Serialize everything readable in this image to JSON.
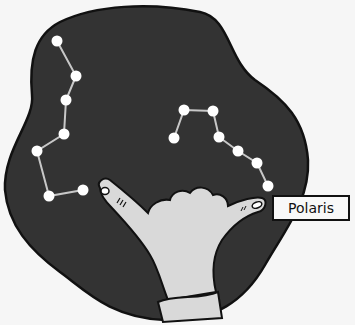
{
  "illustration": {
    "subject": "hand pointing to the North Star",
    "label": "Polaris",
    "colors": {
      "background": "#f6f6f6",
      "sky": "#333333",
      "outline": "#111111",
      "star": "#ffffff",
      "constellation_line": "#c8c8c8",
      "hand": "#d9d9d9",
      "label_bg": "#f8f8f8"
    },
    "constellations": [
      {
        "name": "left-constellation",
        "stars": [
          [
            57,
            41
          ],
          [
            76,
            76
          ],
          [
            66,
            100
          ],
          [
            64,
            134
          ],
          [
            37,
            151
          ],
          [
            49,
            196
          ],
          [
            83,
            190
          ]
        ]
      },
      {
        "name": "right-constellation",
        "stars": [
          [
            174,
            138
          ],
          [
            184,
            110
          ],
          [
            213,
            111
          ],
          [
            219,
            137
          ],
          [
            238,
            151
          ],
          [
            257,
            163
          ],
          [
            268,
            186
          ]
        ]
      }
    ]
  }
}
